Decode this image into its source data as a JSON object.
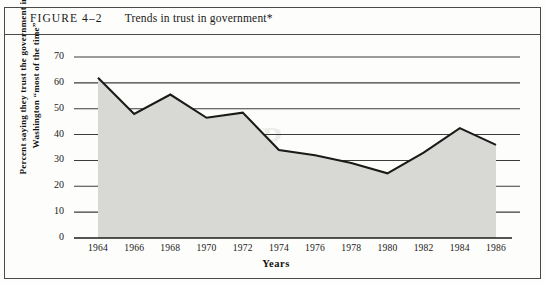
{
  "figure": {
    "number": "FIGURE 4–2",
    "title": "Trends in trust in government*"
  },
  "watermark": {
    "line1": "GROUP",
    "line2": "COPY"
  },
  "chart_data": {
    "type": "area",
    "title": "Trends in trust in government*",
    "xlabel": "Years",
    "ylabel": "Percent saying they trust the government in Washington “most of the time”",
    "x": [
      1964,
      1966,
      1968,
      1970,
      1972,
      1974,
      1976,
      1978,
      1980,
      1982,
      1984,
      1986
    ],
    "values": [
      62,
      48,
      55.5,
      46.5,
      48.5,
      34,
      32,
      29,
      25,
      33,
      42.5,
      36
    ],
    "xticklabels": [
      "1964",
      "1966",
      "1968",
      "1970",
      "1972",
      "1974",
      "1976",
      "1978",
      "1980",
      "1982",
      "1984",
      "1986"
    ],
    "yticklabels": [
      "0",
      "10",
      "20",
      "30",
      "40",
      "50",
      "60",
      "70"
    ],
    "yticks": [
      0,
      10,
      20,
      30,
      40,
      50,
      60,
      70
    ],
    "xlim": [
      1964,
      1986
    ],
    "ylim": [
      0,
      70
    ],
    "grid": true,
    "legend": null,
    "fill_color": "#d8d8d4",
    "line_color": "#1a1a18"
  }
}
